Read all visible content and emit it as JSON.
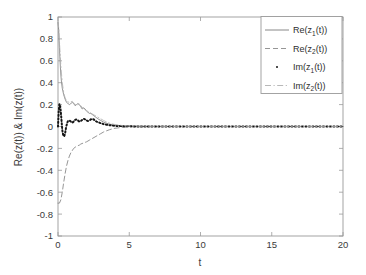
{
  "chart_data": {
    "type": "line",
    "title": "",
    "xlabel": "t",
    "ylabel": "Re(z(t)) & Im(z(t))",
    "xlim": [
      0,
      20
    ],
    "ylim": [
      -1,
      1
    ],
    "grid": false,
    "legend_position": "top-right",
    "xticks": [
      "0",
      "5",
      "10",
      "15",
      "20"
    ],
    "xtick_values": [
      0,
      5,
      10,
      15,
      20
    ],
    "yticks": [
      "-1",
      "-0.8",
      "-0.6",
      "-0.4",
      "-0.2",
      "0",
      "0.2",
      "0.4",
      "0.6",
      "0.8",
      "1"
    ],
    "ytick_values": [
      -1,
      -0.8,
      -0.6,
      -0.4,
      -0.2,
      0,
      0.2,
      0.4,
      0.6,
      0.8,
      1
    ],
    "series": [
      {
        "name": "Re(z1(t))",
        "legend_base": "Re(z",
        "legend_sub": "1",
        "legend_tail": "(t))",
        "style": "solid",
        "color": "#7a7a7a",
        "width": 0.8,
        "x": [
          0,
          0.05,
          0.1,
          0.15,
          0.2,
          0.25,
          0.3,
          0.4,
          0.5,
          0.6,
          0.7,
          0.8,
          0.9,
          1.0,
          1.1,
          1.2,
          1.3,
          1.4,
          1.5,
          1.6,
          1.7,
          1.8,
          1.9,
          2.0,
          2.1,
          2.2,
          2.3,
          2.4,
          2.5,
          2.6,
          2.8,
          3.0,
          3.2,
          3.4,
          3.6,
          3.8,
          4.0,
          4.5,
          5.0,
          6.0,
          8.0,
          10.0,
          12.0,
          15.0,
          20.0
        ],
        "y": [
          0.95,
          0.88,
          0.72,
          0.58,
          0.47,
          0.4,
          0.35,
          0.29,
          0.25,
          0.22,
          0.21,
          0.2,
          0.21,
          0.22,
          0.21,
          0.19,
          0.2,
          0.21,
          0.2,
          0.18,
          0.16,
          0.17,
          0.16,
          0.14,
          0.13,
          0.12,
          0.12,
          0.11,
          0.1,
          0.09,
          0.07,
          0.055,
          0.04,
          0.03,
          0.022,
          0.016,
          0.012,
          0.006,
          0.003,
          0.001,
          0.0,
          0.0,
          0.0,
          0.0,
          0.0
        ]
      },
      {
        "name": "Re(z2(t))",
        "legend_base": "Re(z",
        "legend_sub": "2",
        "legend_tail": "(t))",
        "style": "dashed",
        "color": "#8a8a8a",
        "width": 0.9,
        "x": [
          0,
          0.1,
          0.2,
          0.3,
          0.4,
          0.5,
          0.6,
          0.7,
          0.8,
          0.9,
          1.0,
          1.1,
          1.2,
          1.3,
          1.4,
          1.5,
          1.6,
          1.8,
          2.0,
          2.2,
          2.4,
          2.6,
          2.8,
          3.0,
          3.2,
          3.4,
          3.6,
          3.8,
          4.0,
          4.5,
          5.0,
          6.0,
          8.0,
          10.0,
          12.0,
          15.0,
          20.0
        ],
        "y": [
          -0.7,
          -0.7,
          -0.67,
          -0.6,
          -0.51,
          -0.43,
          -0.36,
          -0.31,
          -0.27,
          -0.24,
          -0.22,
          -0.2,
          -0.19,
          -0.18,
          -0.175,
          -0.17,
          -0.16,
          -0.15,
          -0.14,
          -0.125,
          -0.11,
          -0.095,
          -0.08,
          -0.065,
          -0.05,
          -0.04,
          -0.03,
          -0.022,
          -0.016,
          -0.008,
          -0.004,
          -0.0015,
          0.0,
          0.0,
          0.0,
          0.0,
          0.0
        ]
      },
      {
        "name": "Im(z1(t))",
        "legend_base": "Im(z",
        "legend_sub": "1",
        "legend_tail": "(t))",
        "style": "dotted",
        "color": "#151515",
        "width": 2.0,
        "x": [
          0,
          0.05,
          0.1,
          0.15,
          0.2,
          0.25,
          0.3,
          0.35,
          0.4,
          0.45,
          0.5,
          0.55,
          0.6,
          0.65,
          0.7,
          0.8,
          0.9,
          1.0,
          1.1,
          1.2,
          1.3,
          1.4,
          1.5,
          1.6,
          1.7,
          1.8,
          1.9,
          2.0,
          2.1,
          2.2,
          2.3,
          2.4,
          2.5,
          2.6,
          2.7,
          2.8,
          3.0,
          3.2,
          3.4,
          3.6,
          3.8,
          4.0,
          4.5,
          5.0,
          6.0,
          8.0,
          10.0,
          12.0,
          15.0,
          20.0
        ],
        "y": [
          0.0,
          0.14,
          0.205,
          0.19,
          0.13,
          0.05,
          -0.03,
          -0.07,
          -0.09,
          -0.085,
          -0.06,
          -0.02,
          0.01,
          0.035,
          0.05,
          0.055,
          0.045,
          0.035,
          0.045,
          0.06,
          0.065,
          0.055,
          0.045,
          0.05,
          0.06,
          0.07,
          0.065,
          0.055,
          0.05,
          0.055,
          0.065,
          0.07,
          0.065,
          0.055,
          0.045,
          0.04,
          0.03,
          0.022,
          0.016,
          0.012,
          0.009,
          0.006,
          0.003,
          0.0015,
          0.0005,
          0.0,
          0.0,
          0.0,
          0.0,
          0.0
        ]
      },
      {
        "name": "Im(z2(t))",
        "legend_base": "Im(z",
        "legend_sub": "2",
        "legend_tail": "(t))",
        "style": "dashdot",
        "color": "#b0b0b0",
        "width": 0.8,
        "x": [
          0,
          0.05,
          0.1,
          0.2,
          0.3,
          0.4,
          0.5,
          0.6,
          0.7,
          0.8,
          0.9,
          1.0,
          1.1,
          1.2,
          1.3,
          1.4,
          1.5,
          1.6,
          1.7,
          1.8,
          1.9,
          2.0,
          2.2,
          2.4,
          2.6,
          2.8,
          3.0,
          3.2,
          3.4,
          3.6,
          3.8,
          4.0,
          4.5,
          5.0,
          6.0,
          8.0,
          10.0,
          12.0,
          15.0,
          20.0
        ],
        "y": [
          0.96,
          0.9,
          0.78,
          0.55,
          0.4,
          0.31,
          0.26,
          0.235,
          0.225,
          0.22,
          0.225,
          0.23,
          0.215,
          0.2,
          0.195,
          0.2,
          0.205,
          0.19,
          0.175,
          0.165,
          0.155,
          0.145,
          0.13,
          0.115,
          0.1,
          0.085,
          0.07,
          0.055,
          0.042,
          0.032,
          0.024,
          0.018,
          0.009,
          0.004,
          0.0015,
          0.0,
          0.0,
          0.0,
          0.0,
          0.0
        ]
      }
    ]
  },
  "axes": {
    "box_color": "#9a9a9a",
    "background": "#ffffff"
  },
  "legend": {
    "border_color": "#9a9a9a",
    "background": "#ffffff"
  }
}
